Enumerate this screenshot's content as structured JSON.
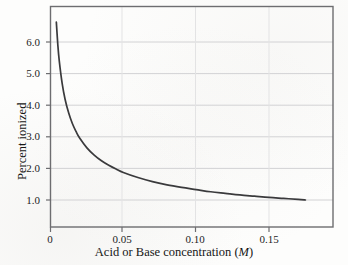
{
  "figure": {
    "background_color": "#fdfdfc",
    "frame_color": "#6d6d70",
    "grid_color": "#d2d2d4",
    "curve_color": "#3a3a3c"
  },
  "axes": {
    "x": {
      "title_text": "Acid or Base concentration (",
      "title_unit": "M",
      "title_tail": ")",
      "ticks": [
        "0",
        "0.05",
        "0.10",
        "0.15"
      ],
      "tick_values": [
        0,
        0.05,
        0.1,
        0.15
      ],
      "range": [
        0,
        0.193
      ]
    },
    "y": {
      "title": "Percent ionized",
      "ticks": [
        "1.0",
        "2.0",
        "3.0",
        "4.0",
        "5.0",
        "6.0"
      ],
      "tick_values": [
        1.0,
        2.0,
        3.0,
        4.0,
        5.0,
        6.0
      ],
      "range": [
        0.3,
        7.0
      ]
    }
  },
  "chart_data": {
    "type": "line",
    "title": "",
    "subtitle": "",
    "xlabel": "Acid or Base concentration (M)",
    "ylabel": "Percent ionized",
    "xlim": [
      0,
      0.193
    ],
    "ylim": [
      0.3,
      7.0
    ],
    "xticks": [
      0,
      0.05,
      0.1,
      0.15
    ],
    "xticklabels": [
      "0",
      "0.05",
      "0.10",
      "0.15"
    ],
    "yticks": [
      1.0,
      2.0,
      3.0,
      4.0,
      5.0,
      6.0
    ],
    "yticklabels": [
      "1.0",
      "2.0",
      "3.0",
      "4.0",
      "5.0",
      "6.0"
    ],
    "grid": "horizontal",
    "legend": "none",
    "series": [
      {
        "name": "Percent ionized vs concentration",
        "relation": "percent = 0.419 / sqrt(concentration)",
        "x": [
          0.004,
          0.005,
          0.006,
          0.008,
          0.01,
          0.0125,
          0.015,
          0.0175,
          0.02,
          0.025,
          0.03,
          0.035,
          0.04,
          0.045,
          0.05,
          0.06,
          0.07,
          0.08,
          0.09,
          0.1,
          0.11,
          0.12,
          0.13,
          0.14,
          0.15,
          0.16,
          0.17,
          0.175
        ],
        "y": [
          6.63,
          5.93,
          5.41,
          4.69,
          4.19,
          3.75,
          3.42,
          3.17,
          2.96,
          2.65,
          2.42,
          2.24,
          2.1,
          1.98,
          1.87,
          1.71,
          1.58,
          1.48,
          1.4,
          1.33,
          1.26,
          1.21,
          1.16,
          1.12,
          1.08,
          1.05,
          1.02,
          1.0
        ]
      }
    ],
    "annotations": []
  }
}
